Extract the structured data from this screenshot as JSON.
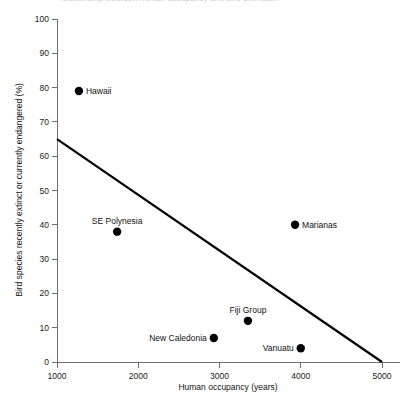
{
  "title_remnant": "relationship between human occupancy and bird extinction",
  "chart_data": {
    "type": "scatter",
    "title": "",
    "xlabel": "Human occupancy (years)",
    "ylabel": "Bird species recently extinct or currently endangered (%)",
    "xlim": [
      1000,
      5000
    ],
    "ylim": [
      0,
      100
    ],
    "xticks": [
      1000,
      2000,
      3000,
      4000,
      5000
    ],
    "yticks": [
      0,
      10,
      20,
      30,
      40,
      50,
      60,
      70,
      80,
      90,
      100
    ],
    "xtick_labels": [
      "1000",
      "2000",
      "3000",
      "4000",
      "5000"
    ],
    "ytick_labels": [
      "0",
      "10",
      "20",
      "30",
      "40",
      "50",
      "60",
      "70",
      "80",
      "90",
      "100"
    ],
    "grid": false,
    "legend": "none",
    "marker_color": "#000000",
    "line_color": "#000000",
    "points": [
      {
        "label": "Hawaii",
        "x": 1270,
        "y": 79,
        "label_pos": "right"
      },
      {
        "label": "SE Polynesia",
        "x": 1740,
        "y": 38,
        "label_pos": "above"
      },
      {
        "label": "Marianas",
        "x": 3930,
        "y": 40,
        "label_pos": "right"
      },
      {
        "label": "Fiji Group",
        "x": 3350,
        "y": 12,
        "label_pos": "above"
      },
      {
        "label": "New Caledonia",
        "x": 2930,
        "y": 7,
        "label_pos": "left"
      },
      {
        "label": "Vanuatu",
        "x": 4000,
        "y": 4,
        "label_pos": "left"
      }
    ],
    "trend_line": {
      "x0": 1000,
      "y0": 65,
      "x1": 5000,
      "y1": 0
    }
  }
}
